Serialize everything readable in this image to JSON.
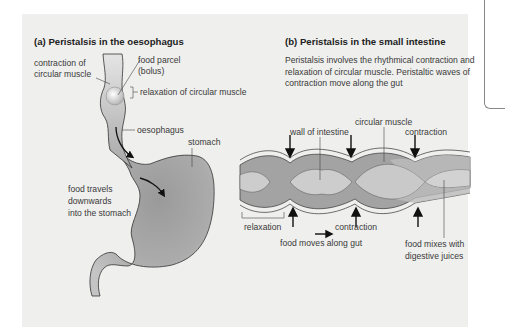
{
  "panel_a": {
    "title": "(a) Peristalsis in the oesophagus",
    "labels": {
      "contraction": "contraction of\ncircular muscle",
      "contraction_line1": "contraction of",
      "contraction_line2": "circular muscle",
      "bolus_line1": "food parcel",
      "bolus_line2": "(bolus)",
      "relaxation": "relaxation of circular muscle",
      "oesophagus": "oesophagus",
      "stomach": "stomach",
      "travels_line1": "food travels",
      "travels_line2": "downwards",
      "travels_line3": "into the stomach"
    }
  },
  "panel_b": {
    "title": "(b) Peristalsis in the small intestine",
    "description": "Peristalsis involves the rhythmical contraction and relaxation of circular muscle. Peristaltic waves of contraction move along the gut",
    "labels": {
      "circular_muscle": "circular muscle",
      "wall": "wall of intestine",
      "contraction_top": "contraction",
      "relaxation": "relaxation",
      "contraction_bottom": "contraction",
      "food_moves": "food moves along gut",
      "mixes_line1": "food mixes with",
      "mixes_line2": "digestive juices"
    }
  },
  "colors": {
    "panel_bg": "#efefed",
    "organ_fill": "#a9a9a9",
    "organ_light": "#cfcfcf",
    "intestine_dark": "#9c9c9c",
    "intestine_light": "#c8c8c8"
  }
}
